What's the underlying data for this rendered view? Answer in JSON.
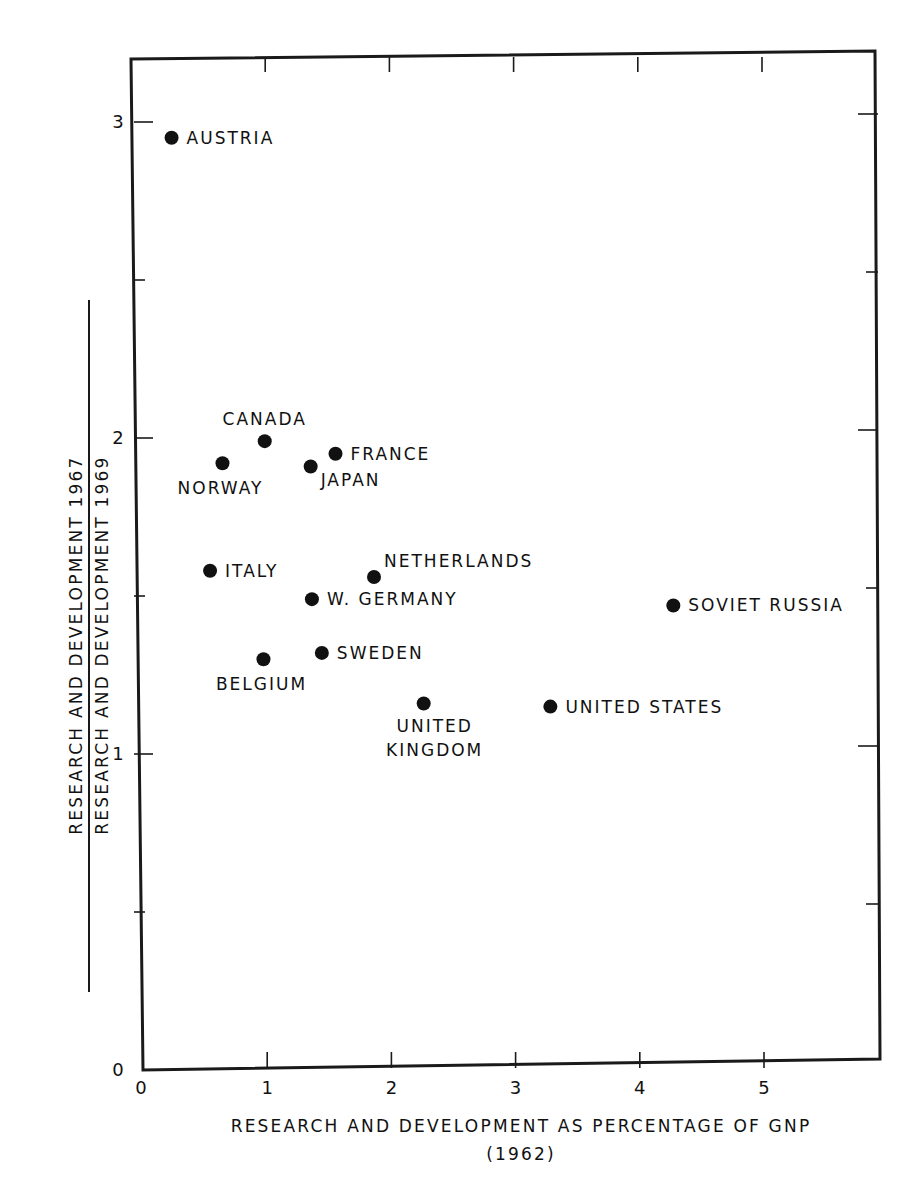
{
  "chart_data": {
    "type": "scatter",
    "title": "",
    "xlabel": "RESEARCH AND DEVELOPMENT AS PERCENTAGE OF GNP",
    "xlabel_sub": "(1962)",
    "ylabel_numerator": "RESEARCH AND DEVELOPMENT 1967",
    "ylabel_denominator": "RESEARCH AND DEVELOPMENT 1969",
    "xlim": [
      0,
      6
    ],
    "ylim": [
      0,
      3.2
    ],
    "x_ticks": [
      0,
      1,
      2,
      3,
      4,
      5
    ],
    "x_tick_labels": [
      "0",
      "1",
      "2",
      "3",
      "4",
      "5"
    ],
    "y_ticks": [
      0,
      1,
      2,
      3
    ],
    "y_tick_labels": [
      "0",
      "1",
      "2",
      "3"
    ],
    "y_minor_ticks": [
      0.5,
      1.5,
      2.5
    ],
    "grid": false,
    "legend": null,
    "points": [
      {
        "label": "AUSTRIA",
        "x": 0.23,
        "y": 2.95,
        "label_pos": "right"
      },
      {
        "label": "CANADA",
        "x": 0.98,
        "y": 1.99,
        "label_pos": "above"
      },
      {
        "label": "NORWAY",
        "x": 0.64,
        "y": 1.92,
        "label_pos": "below"
      },
      {
        "label": "JAPAN",
        "x": 1.35,
        "y": 1.91,
        "label_pos": "below-right"
      },
      {
        "label": "FRANCE",
        "x": 1.55,
        "y": 1.95,
        "label_pos": "right"
      },
      {
        "label": "ITALY",
        "x": 0.54,
        "y": 1.58,
        "label_pos": "right"
      },
      {
        "label": "NETHERLANDS",
        "x": 1.86,
        "y": 1.56,
        "label_pos": "above-right"
      },
      {
        "label": "W. GERMANY",
        "x": 1.36,
        "y": 1.49,
        "label_pos": "right"
      },
      {
        "label": "SWEDEN",
        "x": 1.44,
        "y": 1.32,
        "label_pos": "right"
      },
      {
        "label": "BELGIUM",
        "x": 0.97,
        "y": 1.3,
        "label_pos": "below"
      },
      {
        "label": "UNITED KINGDOM",
        "x": 2.26,
        "y": 1.16,
        "label_pos": "below",
        "label_lines": [
          "UNITED",
          "KINGDOM"
        ]
      },
      {
        "label": "UNITED STATES",
        "x": 3.28,
        "y": 1.15,
        "label_pos": "right"
      },
      {
        "label": "SOVIET RUSSIA",
        "x": 4.27,
        "y": 1.47,
        "label_pos": "right"
      }
    ]
  }
}
